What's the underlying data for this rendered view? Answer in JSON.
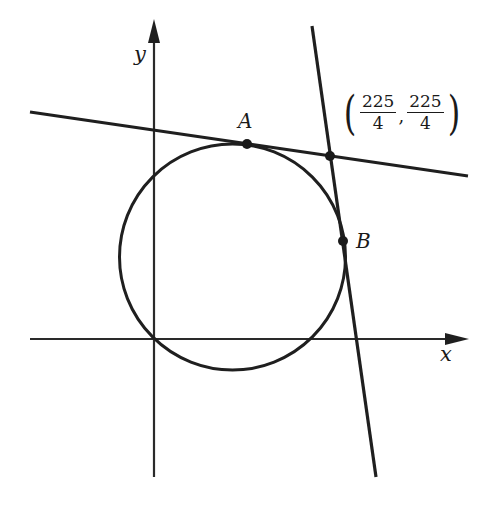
{
  "figure": {
    "colors": {
      "stroke": "#1f1f1f",
      "axis": "#2a2a2a",
      "background": "#ffffff"
    },
    "axes": {
      "x_label": "x",
      "y_label": "y"
    },
    "points": [
      {
        "id": "A",
        "label": "A",
        "role": "tangent point on upper line"
      },
      {
        "id": "B",
        "label": "B",
        "role": "tangent point on steep line"
      },
      {
        "id": "P",
        "label": "(225/4, 225/4)",
        "role": "intersection of the two tangent lines"
      }
    ],
    "intersection_label": {
      "open_paren": "(",
      "x_num": "225",
      "x_den": "4",
      "comma": ",",
      "y_num": "225",
      "y_den": "4",
      "close_paren": ")"
    },
    "shapes": {
      "circle": "circle passing through origin, tangent to both lines",
      "line_1": "nearly horizontal line tangent at A",
      "line_2": "steep line tangent at B"
    }
  }
}
